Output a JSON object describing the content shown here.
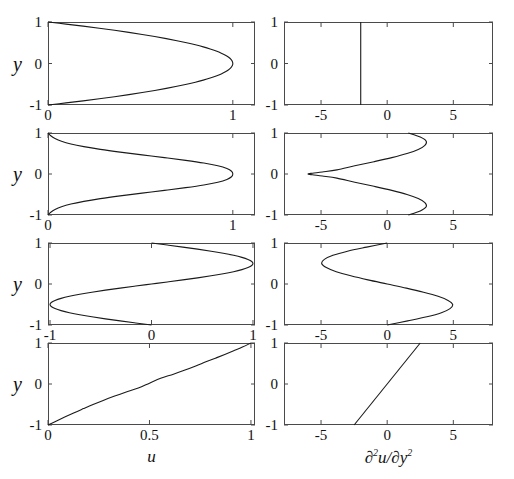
{
  "figure": {
    "axis_labels": {
      "y": "y",
      "x_left": "u",
      "x_right_parts": {
        "d": "∂",
        "sup2": "2",
        "u": "u",
        "slash": "/",
        "d2": "∂",
        "y": "y",
        "sup2b": "2"
      },
      "x_right_plain": "∂2u/∂y2"
    },
    "line_color": "#1a1a1a",
    "axis_color": "#4a4a4a",
    "background": "#ffffff"
  },
  "chart_data": [
    {
      "id": "row1-left",
      "type": "line",
      "title": "",
      "xlabel": "u",
      "ylabel": "y",
      "xlim": [
        0,
        1.12
      ],
      "ylim": [
        -1,
        1
      ],
      "xticks": [
        0,
        1
      ],
      "xtick_labels": [
        "0",
        "1"
      ],
      "yticks": [
        -1,
        0,
        1
      ],
      "ytick_labels": [
        "-1",
        "0",
        "1"
      ],
      "grid": false,
      "legend": "none",
      "profile": "poiseuille",
      "x": [
        0.0,
        0.0975,
        0.19,
        0.2775,
        0.36,
        0.4375,
        0.51,
        0.5775,
        0.64,
        0.6975,
        0.75,
        0.7975,
        0.84,
        0.8775,
        0.91,
        0.9375,
        0.96,
        0.9775,
        0.99,
        0.9975,
        1.0,
        0.9975,
        0.99,
        0.9775,
        0.96,
        0.9375,
        0.91,
        0.8775,
        0.84,
        0.7975,
        0.75,
        0.6975,
        0.64,
        0.5775,
        0.51,
        0.4375,
        0.36,
        0.2775,
        0.19,
        0.0975,
        0.0
      ],
      "y": [
        1.0,
        0.95,
        0.9,
        0.85,
        0.8,
        0.75,
        0.7,
        0.65,
        0.6,
        0.55,
        0.5,
        0.45,
        0.4,
        0.35,
        0.3,
        0.25,
        0.2,
        0.15,
        0.1,
        0.05,
        0.0,
        -0.05,
        -0.1,
        -0.15,
        -0.2,
        -0.25,
        -0.3,
        -0.35,
        -0.4,
        -0.45,
        -0.5,
        -0.55,
        -0.6,
        -0.65,
        -0.7,
        -0.75,
        -0.8,
        -0.85,
        -0.9,
        -0.95,
        -1.0
      ]
    },
    {
      "id": "row1-right",
      "type": "line",
      "title": "",
      "xlabel": "∂2u/∂y2",
      "ylabel": "y",
      "xlim": [
        -7.8,
        8.0
      ],
      "ylim": [
        -1,
        1
      ],
      "xticks": [
        -5,
        0,
        5
      ],
      "xtick_labels": [
        "-5",
        "0",
        "5"
      ],
      "yticks": [
        -1,
        0,
        1
      ],
      "ytick_labels": [
        "-1",
        "0",
        "1"
      ],
      "grid": false,
      "legend": "none",
      "profile": "poiseuille-second-derivative",
      "x": [
        -2.0,
        -2.0
      ],
      "y": [
        1.0,
        -1.0
      ]
    },
    {
      "id": "row2-left",
      "type": "line",
      "title": "",
      "xlabel": "u",
      "ylabel": "y",
      "xlim": [
        0,
        1.12
      ],
      "ylim": [
        -1,
        1
      ],
      "xticks": [
        0,
        1
      ],
      "xtick_labels": [
        "0",
        "1"
      ],
      "yticks": [
        -1,
        0,
        1
      ],
      "ytick_labels": [
        "-1",
        "0",
        "1"
      ],
      "grid": false,
      "legend": "none",
      "profile": "jet",
      "x": [
        0.0,
        0.015,
        0.038,
        0.073,
        0.124,
        0.194,
        0.283,
        0.39,
        0.509,
        0.63,
        0.745,
        0.843,
        0.919,
        0.968,
        0.993,
        1.0,
        0.993,
        0.968,
        0.919,
        0.843,
        0.745,
        0.63,
        0.509,
        0.39,
        0.283,
        0.194,
        0.124,
        0.073,
        0.038,
        0.015,
        0.0
      ],
      "y": [
        1.0,
        0.933,
        0.867,
        0.8,
        0.733,
        0.667,
        0.6,
        0.533,
        0.467,
        0.4,
        0.333,
        0.267,
        0.2,
        0.133,
        0.067,
        0.0,
        -0.067,
        -0.133,
        -0.2,
        -0.267,
        -0.333,
        -0.4,
        -0.467,
        -0.533,
        -0.6,
        -0.667,
        -0.733,
        -0.8,
        -0.867,
        -0.933,
        -1.0
      ]
    },
    {
      "id": "row2-right",
      "type": "line",
      "title": "",
      "xlabel": "∂2u/∂y2",
      "ylabel": "y",
      "xlim": [
        -7.8,
        8.0
      ],
      "ylim": [
        -1,
        1
      ],
      "xticks": [
        -5,
        0,
        5
      ],
      "xtick_labels": [
        "-5",
        "0",
        "5"
      ],
      "yticks": [
        -1,
        0,
        1
      ],
      "ytick_labels": [
        "-1",
        "0",
        "1"
      ],
      "grid": false,
      "legend": "none",
      "profile": "jet-second-derivative",
      "x": [
        1.6,
        2.5,
        2.95,
        2.85,
        2.35,
        1.5,
        0.35,
        -1.0,
        -2.45,
        -3.8,
        -4.9,
        -5.65,
        -6.0,
        -5.65,
        -4.9,
        -3.8,
        -2.45,
        -1.0,
        0.35,
        1.5,
        2.35,
        2.85,
        2.95,
        2.5,
        1.6
      ],
      "y": [
        1.0,
        0.9,
        0.8,
        0.7,
        0.6,
        0.5,
        0.4,
        0.3,
        0.2,
        0.1,
        0.05,
        0.02,
        0.0,
        -0.02,
        -0.05,
        -0.1,
        -0.2,
        -0.3,
        -0.4,
        -0.5,
        -0.6,
        -0.7,
        -0.8,
        -0.9,
        -1.0
      ]
    },
    {
      "id": "row3-left",
      "type": "line",
      "title": "",
      "xlabel": "u",
      "ylabel": "y",
      "xlim": [
        -1.02,
        1.02
      ],
      "ylim": [
        -1,
        1
      ],
      "xticks": [
        -1,
        0,
        1
      ],
      "xtick_labels": [
        "-1",
        "0",
        "1"
      ],
      "yticks": [
        -1,
        0,
        1
      ],
      "ytick_labels": [
        "-1",
        "0",
        "1"
      ],
      "grid": false,
      "legend": "none",
      "profile": "sinusoidal-shear",
      "x": [
        0.0,
        0.156,
        0.309,
        0.454,
        0.588,
        0.707,
        0.809,
        0.891,
        0.951,
        0.988,
        1.0,
        0.988,
        0.951,
        0.891,
        0.809,
        0.707,
        0.588,
        0.454,
        0.309,
        0.156,
        0.0,
        -0.156,
        -0.309,
        -0.454,
        -0.588,
        -0.707,
        -0.809,
        -0.891,
        -0.951,
        -0.988,
        -1.0,
        -0.988,
        -0.951,
        -0.891,
        -0.809,
        -0.707,
        -0.588,
        -0.454,
        -0.309,
        -0.156,
        0.0
      ],
      "y": [
        1.0,
        0.95,
        0.9,
        0.85,
        0.8,
        0.75,
        0.7,
        0.65,
        0.6,
        0.55,
        0.5,
        0.45,
        0.4,
        0.35,
        0.3,
        0.25,
        0.2,
        0.15,
        0.1,
        0.05,
        0.0,
        -0.05,
        -0.1,
        -0.15,
        -0.2,
        -0.25,
        -0.3,
        -0.35,
        -0.4,
        -0.45,
        -0.5,
        -0.55,
        -0.6,
        -0.65,
        -0.7,
        -0.75,
        -0.8,
        -0.85,
        -0.9,
        -0.95,
        -1.0
      ],
      "x_scale_note": "curve peaks near 0.5 and -0.5"
    },
    {
      "id": "row3-right",
      "type": "line",
      "title": "",
      "xlabel": "∂2u/∂y2",
      "ylabel": "y",
      "xlim": [
        -7.8,
        8.0
      ],
      "ylim": [
        -1,
        1
      ],
      "xticks": [
        -5,
        0,
        5
      ],
      "xtick_labels": [
        "-5",
        "0",
        "5"
      ],
      "yticks": [
        -1,
        0,
        1
      ],
      "ytick_labels": [
        "-1",
        "0",
        "1"
      ],
      "grid": false,
      "legend": "none",
      "profile": "sinusoidal-second-derivative",
      "x": [
        0.0,
        -1.55,
        -3.0,
        -4.1,
        -4.75,
        -4.95,
        -4.6,
        -3.85,
        -2.75,
        -1.45,
        0.0,
        1.45,
        2.75,
        3.85,
        4.6,
        4.95,
        4.75,
        4.1,
        3.0,
        1.55,
        0.0
      ],
      "y": [
        1.0,
        0.9,
        0.8,
        0.7,
        0.6,
        0.5,
        0.4,
        0.3,
        0.2,
        0.1,
        0.0,
        -0.1,
        -0.2,
        -0.3,
        -0.4,
        -0.5,
        -0.6,
        -0.7,
        -0.8,
        -0.9,
        -1.0
      ]
    },
    {
      "id": "row4-left",
      "type": "line",
      "title": "",
      "xlabel": "u",
      "ylabel": "y",
      "xlim": [
        0,
        1.02
      ],
      "ylim": [
        -1,
        1
      ],
      "xticks": [
        0,
        0.5,
        1
      ],
      "xtick_labels": [
        "0",
        "0.5",
        "1"
      ],
      "yticks": [
        -1,
        0,
        1
      ],
      "ytick_labels": [
        "-1",
        "0",
        "1"
      ],
      "grid": false,
      "legend": "none",
      "profile": "shear-layer",
      "x": [
        0.0,
        0.042,
        0.085,
        0.129,
        0.175,
        0.222,
        0.272,
        0.325,
        0.382,
        0.445,
        0.5,
        0.555,
        0.618,
        0.675,
        0.728,
        0.778,
        0.825,
        0.871,
        0.915,
        0.958,
        1.0
      ],
      "y": [
        -1.0,
        -0.9,
        -0.8,
        -0.7,
        -0.6,
        -0.5,
        -0.4,
        -0.3,
        -0.2,
        -0.1,
        0.02,
        0.14,
        0.24,
        0.34,
        0.44,
        0.54,
        0.63,
        0.72,
        0.81,
        0.9,
        1.0
      ]
    },
    {
      "id": "row4-right",
      "type": "line",
      "title": "",
      "xlabel": "∂2u/∂y2",
      "ylabel": "y",
      "xlim": [
        -7.8,
        8.0
      ],
      "ylim": [
        -1,
        1
      ],
      "xticks": [
        -5,
        0,
        5
      ],
      "xtick_labels": [
        "-5",
        "0",
        "5"
      ],
      "yticks": [
        -1,
        0,
        1
      ],
      "ytick_labels": [
        "-1",
        "0",
        "1"
      ],
      "grid": false,
      "legend": "none",
      "profile": "shear-layer-second-derivative",
      "x": [
        -2.5,
        2.5
      ],
      "y": [
        -1.0,
        1.0
      ]
    }
  ]
}
